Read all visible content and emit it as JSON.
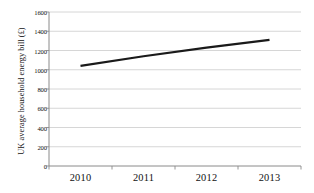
{
  "chart_data": {
    "type": "line",
    "title": "",
    "xlabel": "",
    "ylabel": "UK average household energy bill (£)",
    "categories": [
      "2010",
      "2011",
      "2012",
      "2013"
    ],
    "x": [
      2010,
      2011,
      2012,
      2013
    ],
    "series": [
      {
        "name": "UK average household energy bill",
        "values": [
          1040,
          1140,
          1230,
          1310
        ],
        "color": "#1a1a1a"
      }
    ],
    "values": [
      1040,
      1140,
      1230,
      1310
    ],
    "ylim": [
      0,
      1600
    ],
    "xlim": [
      2009.5,
      2013.5
    ],
    "ytick_labels": [
      "0",
      "200",
      "400",
      "600",
      "800",
      "1000",
      "1200",
      "1400",
      "1600"
    ],
    "ytick_values": [
      0,
      200,
      400,
      600,
      800,
      1000,
      1200,
      1400,
      1600
    ],
    "xtick_labels": [
      "2010",
      "2011",
      "2012",
      "2013"
    ],
    "grid": "horizontal",
    "grid_color": "#cccccc",
    "legend": "none",
    "axis_color": "#808080",
    "background": "#ffffff"
  }
}
